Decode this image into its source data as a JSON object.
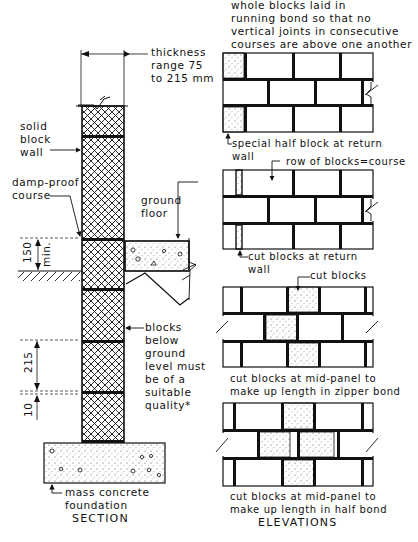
{
  "section": {
    "caption": "SECTION",
    "labels": {
      "thickness": "thickness\nrange 75\nto 215 mm",
      "solid_wall": "solid\nblock\nwall",
      "dpc": "damp-proof\ncourse",
      "ground_floor": "ground\nfloor",
      "below_ground": "blocks\nbelow\nground\nlevel must\nbe of a\nsuitable\nquality*",
      "foundation": "mass concrete\nfoundation"
    },
    "dimensions": {
      "dpc_height": "150",
      "dpc_height_note": "min.",
      "block_height": "215",
      "joint": "10"
    }
  },
  "elevations": {
    "caption": "ELEVATIONS",
    "panels": [
      {
        "id": "running-bond",
        "title": "whole blocks laid in\nrunning bond so that no\nvertical joints in consecutive\ncourses are above one another",
        "note": "special half block at return\nwall"
      },
      {
        "id": "return-wall",
        "title": "row of blocks=course",
        "note": "cut blocks at return\nwall"
      },
      {
        "id": "zipper-bond",
        "title": "cut blocks",
        "note": "cut blocks at mid-panel to\nmake up length in zipper bond"
      },
      {
        "id": "half-bond",
        "title": "",
        "note": "cut blocks at mid-panel to\nmake up length in half bond"
      }
    ]
  },
  "colors": {
    "ink": "#111111",
    "paper": "#ffffff"
  }
}
